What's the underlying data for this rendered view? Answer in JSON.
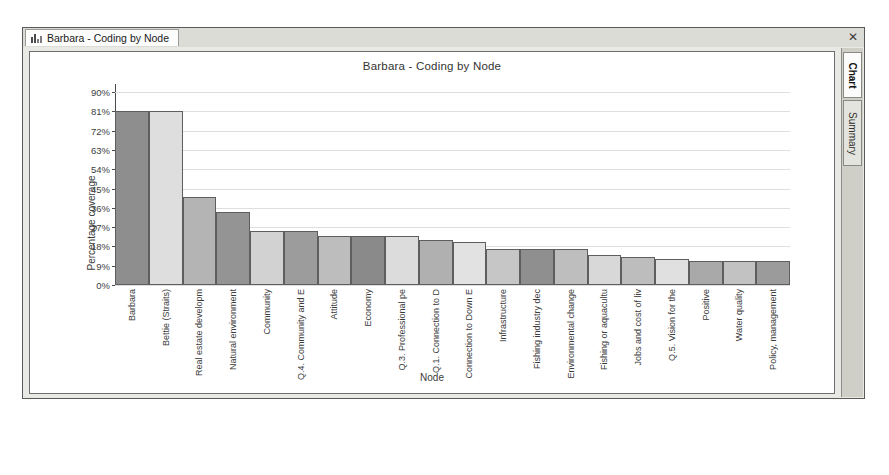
{
  "window": {
    "document_tab_label": "Barbara - Coding by Node",
    "document_tab_icon": "bar-chart-icon",
    "close_label": "✕"
  },
  "side_tabs": [
    {
      "label": "Chart",
      "active": true
    },
    {
      "label": "Summary",
      "active": false
    }
  ],
  "chart_data": {
    "type": "bar",
    "title": "Barbara - Coding by Node",
    "xlabel": "Node",
    "ylabel": "Percentage coverage",
    "ylim": [
      0,
      90
    ],
    "ytick_labels": [
      "90%",
      "81%",
      "72%",
      "63%",
      "54%",
      "45%",
      "36%",
      "27%",
      "18%",
      "9%",
      "0%"
    ],
    "ytick_values": [
      90,
      81,
      72,
      63,
      54,
      45,
      36,
      27,
      18,
      9,
      0
    ],
    "grid": true,
    "legend": "none",
    "categories": [
      "Barbara",
      "Bettie (Straits)",
      "Real estate developm",
      "Natural environment",
      "Community",
      "Q.4. Community and E",
      "Attitude",
      "Economy",
      "Q.3. Professional pe",
      "Q.1. Connection to D",
      "Connection to Down E",
      "Infrastructure",
      "Fishing industry dec",
      "Environmental change",
      "Fishing or aquacultu",
      "Jobs and cost of liv",
      "Q.5. Vision for the",
      "Positive",
      "Water quality",
      "Policy, management"
    ],
    "values": [
      81,
      81,
      41,
      34,
      25,
      25,
      23,
      23,
      23,
      21,
      20,
      17,
      17,
      17,
      14,
      13,
      12,
      11,
      11,
      11
    ],
    "bar_colors": [
      "#8e8e8e",
      "#dedede",
      "#b4b4b4",
      "#949494",
      "#d2d2d2",
      "#9c9c9c",
      "#bdbdbd",
      "#8a8a8a",
      "#dcdcdc",
      "#b0b0b0",
      "#e2e2e2",
      "#c6c6c6",
      "#8f8f8f",
      "#bebebe",
      "#d8d8d8",
      "#bdbdbd",
      "#e0e0e0",
      "#a9a9a9",
      "#c2c2c2",
      "#9b9b9b"
    ]
  }
}
